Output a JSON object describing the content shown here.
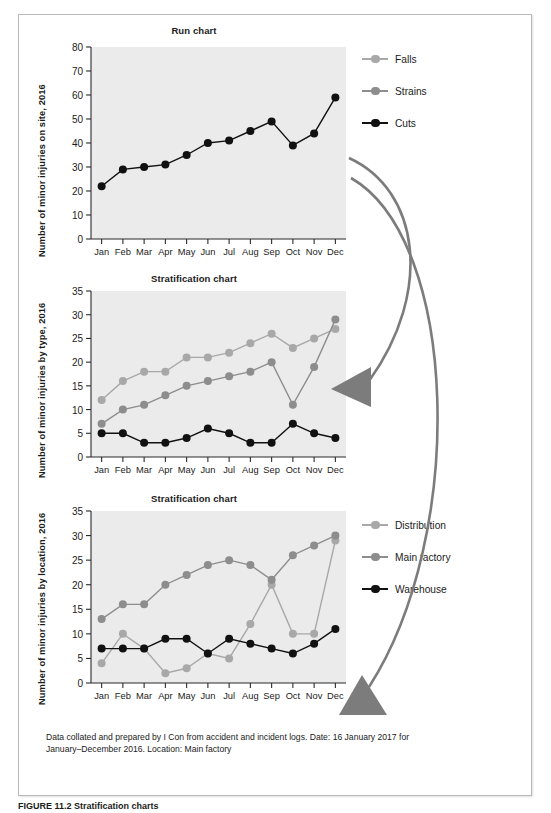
{
  "figure": {
    "caption_note_line1": "Data collated and prepared by I Con from accident and incident logs. Date: 16 January 2017 for",
    "caption_note_line2": "January–December 2016. Location: Main factory",
    "figure_caption": "FIGURE 11.2 Stratification charts"
  },
  "colors": {
    "plot_background": "#ebebeb",
    "axis": "#2b2b2b",
    "series_light_gray": "#a8a8a8",
    "series_mid_gray": "#8d8d8d",
    "series_black": "#111111",
    "arrow_gray": "#7c7c7c",
    "border": "#b9b9b9"
  },
  "chart_data": [
    {
      "id": "run-chart",
      "type": "line",
      "title": "Run chart",
      "xlabel": "",
      "ylabel": "Number of minor injuries on site, 2016",
      "categories": [
        "Jan",
        "Feb",
        "Mar",
        "Apr",
        "May",
        "Jun",
        "Jul",
        "Aug",
        "Sep",
        "Oct",
        "Nov",
        "Dec"
      ],
      "ylim": [
        0,
        80
      ],
      "yticks": [
        0,
        10,
        20,
        30,
        40,
        50,
        60,
        70,
        80
      ],
      "grid": false,
      "legend": null,
      "series": [
        {
          "name": "Injuries",
          "color": "#111111",
          "values": [
            22,
            29,
            30,
            31,
            35,
            40,
            41,
            45,
            49,
            39,
            44,
            59
          ]
        }
      ]
    },
    {
      "id": "stratification-by-type",
      "type": "line",
      "title": "Stratification chart",
      "xlabel": "",
      "ylabel": "Number of minor injuries by type, 2016",
      "categories": [
        "Jan",
        "Feb",
        "Mar",
        "Apr",
        "May",
        "Jun",
        "Jul",
        "Aug",
        "Sep",
        "Oct",
        "Nov",
        "Dec"
      ],
      "ylim": [
        0,
        35
      ],
      "yticks": [
        0,
        5,
        10,
        15,
        20,
        25,
        30,
        35
      ],
      "grid": false,
      "legend_position": "right",
      "series": [
        {
          "name": "Falls",
          "color": "#a8a8a8",
          "values": [
            12,
            16,
            18,
            18,
            21,
            21,
            22,
            24,
            26,
            23,
            25,
            27
          ]
        },
        {
          "name": "Strains",
          "color": "#8d8d8d",
          "values": [
            7,
            10,
            11,
            13,
            15,
            16,
            17,
            18,
            20,
            11,
            19,
            29
          ]
        },
        {
          "name": "Cuts",
          "color": "#111111",
          "values": [
            5,
            5,
            3,
            3,
            4,
            6,
            5,
            3,
            3,
            7,
            5,
            4
          ]
        }
      ]
    },
    {
      "id": "stratification-by-location",
      "type": "line",
      "title": "Stratification chart",
      "xlabel": "",
      "ylabel": "Number of minor injuries by location, 2016",
      "categories": [
        "Jan",
        "Feb",
        "Mar",
        "Apr",
        "May",
        "Jun",
        "Jul",
        "Aug",
        "Sep",
        "Oct",
        "Nov",
        "Dec"
      ],
      "ylim": [
        0,
        35
      ],
      "yticks": [
        0,
        5,
        10,
        15,
        20,
        25,
        30,
        35
      ],
      "grid": false,
      "legend_position": "right",
      "series": [
        {
          "name": "Distribution",
          "color": "#a8a8a8",
          "values": [
            4,
            10,
            7,
            2,
            3,
            6,
            5,
            12,
            20,
            10,
            10,
            29
          ]
        },
        {
          "name": "Main factory",
          "color": "#8d8d8d",
          "values": [
            13,
            16,
            16,
            20,
            22,
            24,
            25,
            24,
            21,
            26,
            28,
            30
          ]
        },
        {
          "name": "Warehouse",
          "color": "#111111",
          "values": [
            7,
            7,
            7,
            9,
            9,
            6,
            9,
            8,
            7,
            6,
            8,
            11
          ]
        }
      ]
    }
  ]
}
